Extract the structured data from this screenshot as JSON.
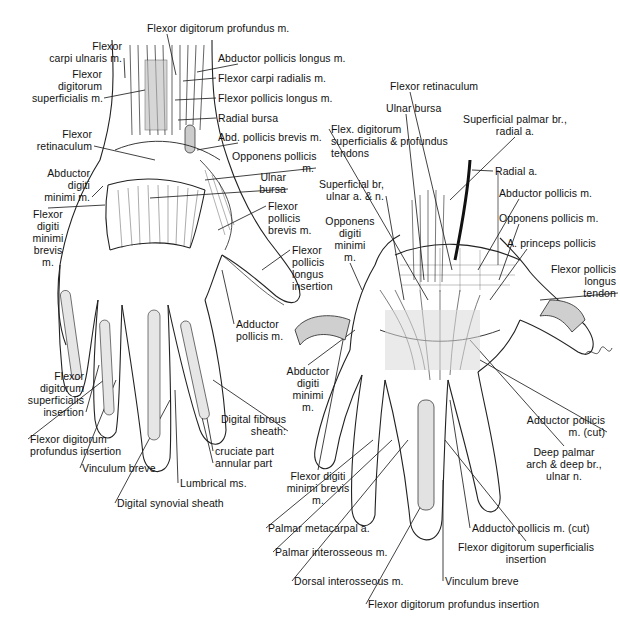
{
  "figure": {
    "left_hand": {
      "view": "palmar, superficial",
      "labels": [
        {
          "id": "fdp-m",
          "lines": [
            "Flexor digitorum profundus m."
          ],
          "x": 147,
          "y": 22,
          "align": "l",
          "target": [
            176,
            75
          ]
        },
        {
          "id": "fcu-m",
          "lines": [
            "Flexor",
            "carpi ulnaris m."
          ],
          "x": 22,
          "y": 40,
          "align": "r",
          "w": 100,
          "target": [
            125,
            78
          ]
        },
        {
          "id": "fds-m",
          "lines": [
            "Flexor",
            "digitorum",
            "superficialis m."
          ],
          "x": 32,
          "y": 68,
          "align": "r",
          "w": 70,
          "target": [
            145,
            90
          ]
        },
        {
          "id": "apl-m",
          "lines": [
            "Abductor pollicis longus m."
          ],
          "x": 218,
          "y": 52,
          "align": "l",
          "target": [
            197,
            72
          ]
        },
        {
          "id": "fcr-m",
          "lines": [
            "Flexor carpi radialis m."
          ],
          "x": 218,
          "y": 72,
          "align": "l",
          "target": [
            183,
            81
          ]
        },
        {
          "id": "fpl-m",
          "lines": [
            "Flexor pollicis longus m."
          ],
          "x": 218,
          "y": 92,
          "align": "l",
          "target": [
            175,
            100
          ]
        },
        {
          "id": "radial-bursa",
          "lines": [
            "Radial bursa"
          ],
          "x": 218,
          "y": 112,
          "align": "l",
          "target": [
            178,
            120
          ]
        },
        {
          "id": "apb-m",
          "lines": [
            "Abd. pollicis brevis m."
          ],
          "x": 218,
          "y": 131,
          "align": "l",
          "target": [
            197,
            150
          ]
        },
        {
          "id": "flexor-retinaculum-l",
          "lines": [
            "Flexor",
            "retinaculum"
          ],
          "x": 20,
          "y": 128,
          "align": "r",
          "w": 72,
          "target": [
            155,
            160
          ]
        },
        {
          "id": "opponens-pollicis-l",
          "lines": [
            "Opponens pollicis",
            "m."
          ],
          "x": 232,
          "y": 150,
          "align": "r",
          "w": 82,
          "target": [
            205,
            180
          ]
        },
        {
          "id": "ulnar-bursa-l",
          "lines": [
            "Ulnar",
            "bursa"
          ],
          "x": 250,
          "y": 171,
          "align": "r",
          "w": 36,
          "target": [
            150,
            198
          ]
        },
        {
          "id": "adm-m-l",
          "lines": [
            "Abductor",
            "digiti",
            "minimi m."
          ],
          "x": 20,
          "y": 167,
          "align": "r",
          "w": 70,
          "target": [
            103,
            186
          ]
        },
        {
          "id": "fdmb-m-l",
          "lines": [
            "Flexor",
            "digiti",
            "minimi",
            "brevis",
            "m."
          ],
          "x": 18,
          "y": 208,
          "align": "c",
          "w": 60,
          "target": [
            105,
            205
          ]
        },
        {
          "id": "fpb-m",
          "lines": [
            "Flexor",
            "pollicis",
            "brevis m."
          ],
          "x": 268,
          "y": 200,
          "align": "l",
          "target": [
            218,
            230
          ]
        },
        {
          "id": "fpl-insertion",
          "lines": [
            "Flexor",
            "pollicis",
            "longus",
            "insertion"
          ],
          "x": 292,
          "y": 244,
          "align": "l",
          "target": [
            262,
            270
          ]
        },
        {
          "id": "adductor-pollicis-l",
          "lines": [
            "Adductor",
            "pollicis m."
          ],
          "x": 236,
          "y": 318,
          "align": "l",
          "target": [
            222,
            270
          ]
        },
        {
          "id": "fds-insertion",
          "lines": [
            "Flexor",
            "digitorum",
            "superficialis",
            "insertion"
          ],
          "x": 20,
          "y": 370,
          "align": "r",
          "w": 64,
          "target": [
            99,
            365
          ]
        },
        {
          "id": "fdp-insertion-l",
          "lines": [
            "Flexor digitorum",
            "profundus insertion"
          ],
          "x": 30,
          "y": 433,
          "align": "l",
          "target": [
            104,
            380
          ]
        },
        {
          "id": "vinculum-breve-l",
          "lines": [
            "Vinculum breve"
          ],
          "x": 82,
          "y": 462,
          "align": "l",
          "target": [
            116,
            380
          ]
        },
        {
          "id": "digital-fibrous-sheath",
          "lines": [
            "Digital fibrous",
            "sheath:"
          ],
          "x": 220,
          "y": 413,
          "align": "r",
          "w": 66,
          "target": [
            213,
            380
          ]
        },
        {
          "id": "cruciate-part",
          "lines": [
            "cruciate part"
          ],
          "x": 215,
          "y": 445,
          "align": "l",
          "target": [
            200,
            380
          ]
        },
        {
          "id": "annular-part",
          "lines": [
            "annular part"
          ],
          "x": 215,
          "y": 457,
          "align": "l",
          "target": [
            193,
            380
          ]
        },
        {
          "id": "lumbrical-ms",
          "lines": [
            "Lumbrical ms."
          ],
          "x": 180,
          "y": 477,
          "align": "l",
          "target": [
            175,
            390
          ]
        },
        {
          "id": "digital-synovial-sheath",
          "lines": [
            "Digital synovial sheath"
          ],
          "x": 117,
          "y": 497,
          "align": "l",
          "target": [
            170,
            400
          ]
        }
      ]
    },
    "right_hand": {
      "view": "palmar, deep",
      "signature": "Vilhelm",
      "labels": [
        {
          "id": "flexor-retinaculum-r",
          "lines": [
            "Flexor retinaculum"
          ],
          "x": 390,
          "y": 80,
          "align": "l",
          "target": [
            452,
            270
          ]
        },
        {
          "id": "ulnar-bursa-r",
          "lines": [
            "Ulnar bursa"
          ],
          "x": 386,
          "y": 102,
          "align": "l",
          "target": [
            424,
            280
          ]
        },
        {
          "id": "superficial-palmar-br",
          "lines": [
            "Superficial palmar br.,",
            "radial a."
          ],
          "x": 460,
          "y": 113,
          "align": "c",
          "w": 110,
          "target": [
            450,
            200
          ]
        },
        {
          "id": "flex-digitorum-tendons",
          "lines": [
            "Flex. digitorum",
            "superficialis & profundus",
            "tendons"
          ],
          "x": 331,
          "y": 123,
          "align": "l",
          "w": 100,
          "target": [
            428,
            300
          ]
        },
        {
          "id": "radial-a",
          "lines": [
            "Radial a."
          ],
          "x": 495,
          "y": 165,
          "align": "l",
          "target": [
            472,
            170
          ]
        },
        {
          "id": "superficial-br-ulnar",
          "lines": [
            "Superficial br,",
            "ulnar a. & n."
          ],
          "x": 312,
          "y": 178,
          "align": "r",
          "w": 72,
          "target": [
            404,
            300
          ]
        },
        {
          "id": "abductor-pollicis-m",
          "lines": [
            "Abductor pollicis m."
          ],
          "x": 499,
          "y": 187,
          "align": "l",
          "target": [
            478,
            270
          ]
        },
        {
          "id": "opponens-pollicis-r",
          "lines": [
            "Opponens pollicis m."
          ],
          "x": 499,
          "y": 212,
          "align": "l",
          "target": [
            499,
            280
          ]
        },
        {
          "id": "opponens-digiti-minimi",
          "lines": [
            "Opponens",
            "digiti",
            "minimi",
            "m."
          ],
          "x": 322,
          "y": 215,
          "align": "c",
          "w": 56,
          "target": [
            362,
            290
          ]
        },
        {
          "id": "a-princeps-pollicis",
          "lines": [
            "A. princeps pollicis"
          ],
          "x": 507,
          "y": 237,
          "align": "l",
          "target": [
            490,
            300
          ]
        },
        {
          "id": "fpl-tendon",
          "lines": [
            "Flexor pollicis",
            "longus",
            "tendon"
          ],
          "x": 534,
          "y": 263,
          "align": "r",
          "w": 82,
          "target": [
            540,
            300
          ]
        },
        {
          "id": "adm-m-r",
          "lines": [
            "Abductor",
            "digiti",
            "minimi",
            "m."
          ],
          "x": 280,
          "y": 365,
          "align": "c",
          "w": 56,
          "target": [
            355,
            330
          ]
        },
        {
          "id": "adductor-pollicis-cut-1",
          "lines": [
            "Adductor pollicis",
            "m. (cut)"
          ],
          "x": 521,
          "y": 414,
          "align": "r",
          "w": 84,
          "target": [
            480,
            360
          ]
        },
        {
          "id": "deep-palmar-arch",
          "lines": [
            "Deep palmar",
            "arch & deep br.,",
            "ulnar n."
          ],
          "x": 522,
          "y": 446,
          "align": "c",
          "w": 84,
          "target": [
            470,
            340
          ]
        },
        {
          "id": "fdmb-m-r",
          "lines": [
            "Flexor digiti",
            "minimi brevis",
            "m."
          ],
          "x": 285,
          "y": 470,
          "align": "c",
          "w": 66,
          "target": [
            345,
            330
          ]
        },
        {
          "id": "palmar-metacarpal-a",
          "lines": [
            "Palmar metacarpal a."
          ],
          "x": 268,
          "y": 522,
          "align": "l",
          "target": [
            373,
            440
          ]
        },
        {
          "id": "adductor-pollicis-cut-2",
          "lines": [
            "Adductor pollicis m. (cut)"
          ],
          "x": 472,
          "y": 522,
          "align": "l",
          "target": [
            450,
            400
          ]
        },
        {
          "id": "fds-insertion-r",
          "lines": [
            "Flexor digitorum superficialis",
            "insertion"
          ],
          "x": 456,
          "y": 541,
          "align": "c",
          "w": 140,
          "target": [
            445,
            440
          ]
        },
        {
          "id": "palmar-interosseous",
          "lines": [
            "Palmar interosseous m."
          ],
          "x": 275,
          "y": 546,
          "align": "l",
          "target": [
            392,
            440
          ]
        },
        {
          "id": "dorsal-interosseous",
          "lines": [
            "Dorsal interosseous m."
          ],
          "x": 294,
          "y": 575,
          "align": "l",
          "target": [
            408,
            440
          ]
        },
        {
          "id": "vinculum-breve-r",
          "lines": [
            "Vinculum breve"
          ],
          "x": 445,
          "y": 575,
          "align": "l",
          "target": [
            443,
            480
          ]
        },
        {
          "id": "fdp-insertion-r",
          "lines": [
            "Flexor digitorum profundus insertion"
          ],
          "x": 368,
          "y": 598,
          "align": "l",
          "target": [
            430,
            490
          ]
        }
      ]
    }
  }
}
